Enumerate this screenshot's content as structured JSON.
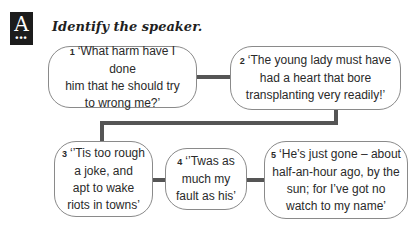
{
  "header": {
    "logo_letter": "A",
    "logo_dots": "•••",
    "title": "Identify the speaker."
  },
  "quotes": [
    {
      "number": "1",
      "text": "‘What harm have I done him that he should try to wrong me?’",
      "lines": [
        "‘What harm have I done",
        "him that he should try",
        "to wrong me?’"
      ]
    },
    {
      "number": "2",
      "text": "‘The young lady must have had a heart that bore transplanting very readily!’",
      "lines": [
        "‘The young lady must have",
        "had a heart that bore",
        "transplanting very readily!’"
      ]
    },
    {
      "number": "3",
      "text": "‘’Tis too rough a joke, and apt to wake riots in towns’",
      "lines": [
        "‘’Tis too rough",
        "a joke, and",
        "apt to wake",
        "riots in towns’"
      ]
    },
    {
      "number": "4",
      "text": "‘’Twas as much my fault as his’",
      "lines": [
        "‘’Twas as",
        "much my",
        "fault as his’"
      ]
    },
    {
      "number": "5",
      "text": "‘He’s just gone – about half-an-hour ago, by the sun; for I’ve got no watch to my name’",
      "lines": [
        "‘He’s just gone – about",
        "half-an-hour ago, by the",
        "sun; for I’ve got no",
        "watch to my name’"
      ]
    }
  ],
  "colors": {
    "connector": "#555555",
    "border": "#8a8a8a",
    "logo_bg": "#1c1c1c"
  }
}
